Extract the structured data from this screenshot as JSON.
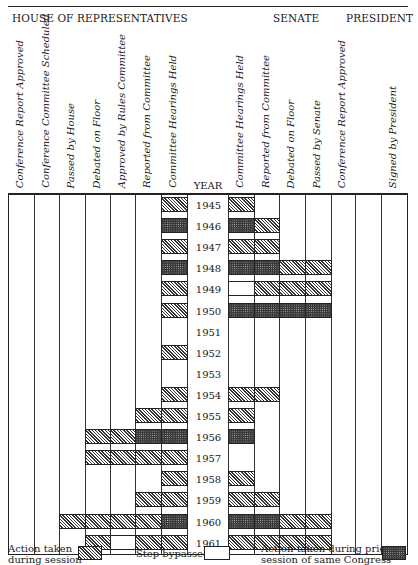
{
  "chart_data": {
    "type": "table",
    "title": "",
    "sections": [
      {
        "name": "HOUSE OF REPRESENTATIVES",
        "columns": [
          "Conference Report Approved",
          "Conference Committee Scheduled",
          "Passed by House",
          "Debated on Floor",
          "Approved by Rules Committee",
          "Reported from Committee",
          "Committee Hearings Held"
        ]
      },
      {
        "name": "SENATE",
        "columns": [
          "Committee Hearings Held",
          "Reported from Committee",
          "Debated on Floor",
          "Passed by Senate",
          "Conference Report Approved"
        ]
      },
      {
        "name": "PRESIDENT",
        "columns": [
          "",
          "Signed by President"
        ]
      }
    ],
    "year_label": "YEAR",
    "legend": {
      "S": "Action taken during session",
      "B": "Step bypassed",
      "P": "Action taken during prior session of same Congress"
    },
    "rows": [
      {
        "year": "1945",
        "house": [
          "",
          "",
          "",
          "",
          "",
          "",
          "S"
        ],
        "senate": [
          "S",
          "",
          "",
          "",
          ""
        ],
        "president": [
          "",
          ""
        ]
      },
      {
        "year": "1946",
        "house": [
          "",
          "",
          "",
          "",
          "",
          "",
          "P"
        ],
        "senate": [
          "P",
          "S",
          "",
          "",
          ""
        ],
        "president": [
          "",
          ""
        ]
      },
      {
        "year": "1947",
        "house": [
          "",
          "",
          "",
          "",
          "",
          "",
          "S"
        ],
        "senate": [
          "S",
          "S",
          "",
          "",
          ""
        ],
        "president": [
          "",
          ""
        ]
      },
      {
        "year": "1948",
        "house": [
          "",
          "",
          "",
          "",
          "",
          "",
          "P"
        ],
        "senate": [
          "P",
          "P",
          "S",
          "S",
          ""
        ],
        "president": [
          "",
          ""
        ]
      },
      {
        "year": "1949",
        "house": [
          "",
          "",
          "",
          "",
          "",
          "",
          "S"
        ],
        "senate": [
          "B",
          "S",
          "S",
          "S",
          ""
        ],
        "president": [
          "",
          ""
        ]
      },
      {
        "year": "1950",
        "house": [
          "",
          "",
          "",
          "",
          "",
          "",
          "S"
        ],
        "senate": [
          "P",
          "P",
          "P",
          "P",
          ""
        ],
        "president": [
          "",
          ""
        ]
      },
      {
        "year": "1951",
        "house": [
          "",
          "",
          "",
          "",
          "",
          "",
          ""
        ],
        "senate": [
          "",
          "",
          "",
          "",
          ""
        ],
        "president": [
          "",
          ""
        ]
      },
      {
        "year": "1952",
        "house": [
          "",
          "",
          "",
          "",
          "",
          "",
          "S"
        ],
        "senate": [
          "",
          "",
          "",
          "",
          ""
        ],
        "president": [
          "",
          ""
        ]
      },
      {
        "year": "1953",
        "house": [
          "",
          "",
          "",
          "",
          "",
          "",
          ""
        ],
        "senate": [
          "",
          "",
          "",
          "",
          ""
        ],
        "president": [
          "",
          ""
        ]
      },
      {
        "year": "1954",
        "house": [
          "",
          "",
          "",
          "",
          "",
          "",
          "S"
        ],
        "senate": [
          "S",
          "S",
          "",
          "",
          ""
        ],
        "president": [
          "",
          ""
        ]
      },
      {
        "year": "1955",
        "house": [
          "",
          "",
          "",
          "",
          "",
          "S",
          "S"
        ],
        "senate": [
          "S",
          "",
          "",
          "",
          ""
        ],
        "president": [
          "",
          ""
        ]
      },
      {
        "year": "1956",
        "house": [
          "",
          "",
          "",
          "S",
          "S",
          "P",
          "P"
        ],
        "senate": [
          "P",
          "",
          "",
          "",
          ""
        ],
        "president": [
          "",
          ""
        ]
      },
      {
        "year": "1957",
        "house": [
          "",
          "",
          "",
          "S",
          "S",
          "S",
          "S"
        ],
        "senate": [
          "",
          "",
          "",
          "",
          ""
        ],
        "president": [
          "",
          ""
        ]
      },
      {
        "year": "1958",
        "house": [
          "",
          "",
          "",
          "",
          "",
          "",
          "S"
        ],
        "senate": [
          "S",
          "",
          "",
          "",
          ""
        ],
        "president": [
          "",
          ""
        ]
      },
      {
        "year": "1959",
        "house": [
          "",
          "",
          "",
          "",
          "",
          "S",
          "S"
        ],
        "senate": [
          "S",
          "S",
          "",
          "",
          ""
        ],
        "president": [
          "",
          ""
        ]
      },
      {
        "year": "1960",
        "house": [
          "",
          "",
          "S",
          "S",
          "S",
          "S",
          "P"
        ],
        "senate": [
          "P",
          "P",
          "S",
          "S",
          ""
        ],
        "president": [
          "",
          ""
        ]
      },
      {
        "year": "1961",
        "house": [
          "",
          "",
          "",
          "S",
          "B",
          "S",
          "S"
        ],
        "senate": [
          "S",
          "S",
          "S",
          "S",
          ""
        ],
        "president": [
          "",
          ""
        ]
      }
    ]
  },
  "header": {
    "house": "HOUSE OF REPRESENTATIVES",
    "senate": "SENATE",
    "president": "PRESIDENT",
    "year": "YEAR"
  },
  "columns": {
    "house": [
      "Conference Report Approved",
      "Conference Committee Scheduled",
      "Passed by House",
      "Debated on Floor",
      "Approved by Rules Committee",
      "Reported from Committee",
      "Committee Hearings Held"
    ],
    "senate": [
      "Committee Hearings Held",
      "Reported from Committee",
      "Debated on Floor",
      "Passed by Senate",
      "Conference Report Approved"
    ],
    "president": [
      "",
      "Signed by President"
    ]
  },
  "legend": {
    "session_line1": "Action taken",
    "session_line2": "during session",
    "bypassed": "Step bypassed",
    "prior_line1": "Action taken during prior",
    "prior_line2": "session of same Congress"
  }
}
